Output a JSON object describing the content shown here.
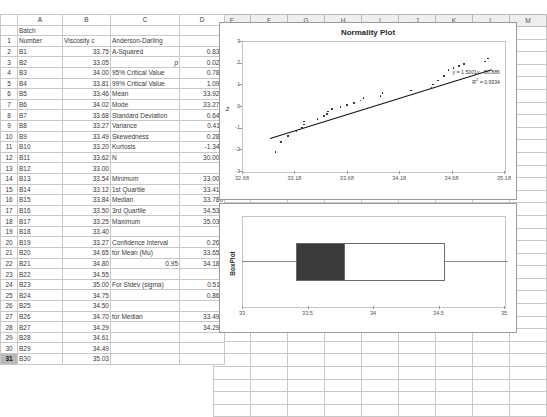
{
  "spreadsheet": {
    "column_headers": [
      "A",
      "B",
      "C",
      "D",
      "E",
      "F",
      "G",
      "H",
      "I",
      "J",
      "K",
      "L",
      "M"
    ],
    "selected_row": "31",
    "headers": {
      "a": "Batch Number",
      "a_line1": "Batch",
      "a_line2": "Number",
      "b": "Viscosity c",
      "c": "Anderson-Darling",
      "d": ""
    },
    "rows": [
      {
        "n": "2",
        "a": "B1",
        "b": "33.75",
        "c": "A-Squared",
        "d": "0.833",
        "italic": false
      },
      {
        "n": "3",
        "a": "B2",
        "b": "33.05",
        "c": "p",
        "d": "0.028",
        "italic": true
      },
      {
        "n": "4",
        "a": "B3",
        "b": "34.00",
        "c": "95% Critical Value",
        "d": "0.787",
        "italic": false
      },
      {
        "n": "5",
        "a": "B4",
        "b": "33.81",
        "c": "99% Critical Value",
        "d": "1.092",
        "italic": false
      },
      {
        "n": "6",
        "a": "B5",
        "b": "33.46",
        "c": "Mean",
        "d": "33.921",
        "italic": false
      },
      {
        "n": "7",
        "a": "B6",
        "b": "34.02",
        "c": "Mode",
        "d": "33.270",
        "italic": false
      },
      {
        "n": "8",
        "a": "B7",
        "b": "33.68",
        "c": "Standard Deviation",
        "d": "0.641",
        "italic": false
      },
      {
        "n": "9",
        "a": "B8",
        "b": "33.27",
        "c": "Variance",
        "d": "0.411",
        "italic": false
      },
      {
        "n": "10",
        "a": "B9",
        "b": "33.49",
        "c": "Skewedness",
        "d": "0.286",
        "italic": false
      },
      {
        "n": "11",
        "a": "B10",
        "b": "33.20",
        "c": "Kurtosis",
        "d": "-1.342",
        "italic": false
      },
      {
        "n": "12",
        "a": "B11",
        "b": "33.62",
        "c": "N",
        "d": "30.000",
        "italic": false
      },
      {
        "n": "13",
        "a": "B12",
        "b": "33.00",
        "c": "",
        "d": "",
        "italic": false
      },
      {
        "n": "14",
        "a": "B13",
        "b": "33.54",
        "c": "Minimum",
        "d": "33.000",
        "italic": false
      },
      {
        "n": "15",
        "a": "B14",
        "b": "33.12",
        "c": "1st Quartile",
        "d": "33.415",
        "italic": false
      },
      {
        "n": "16",
        "a": "B15",
        "b": "33.84",
        "c": "Median",
        "d": "33.780",
        "italic": false
      },
      {
        "n": "17",
        "a": "B16",
        "b": "33.50",
        "c": "3rd Quartile",
        "d": "34.538",
        "italic": false
      },
      {
        "n": "18",
        "a": "B17",
        "b": "33.25",
        "c": "Maximum",
        "d": "35.030",
        "italic": false
      },
      {
        "n": "19",
        "a": "B18",
        "b": "33.40",
        "c": "",
        "d": "",
        "italic": false
      },
      {
        "n": "20",
        "a": "B19",
        "b": "33.27",
        "c": "Confidence Interval",
        "d": "0.262",
        "italic": false
      },
      {
        "n": "21",
        "a": "B20",
        "b": "34.65",
        "c": "for Mean (Mu)",
        "d": "33.659",
        "italic": false
      },
      {
        "n": "22",
        "a": "B21",
        "b": "34.80",
        "c": "0.95",
        "d": "34.184",
        "italic": false,
        "c_right": true
      },
      {
        "n": "23",
        "a": "B22",
        "b": "34.55",
        "c": "",
        "d": "",
        "italic": false
      },
      {
        "n": "24",
        "a": "B23",
        "b": "35.00",
        "c": "For Stdev (sigma)",
        "d": "0.511",
        "italic": false
      },
      {
        "n": "25",
        "a": "B24",
        "b": "34.75",
        "c": "",
        "d": "0.862",
        "italic": false
      },
      {
        "n": "26",
        "a": "B25",
        "b": "34.50",
        "c": "",
        "d": "",
        "italic": false
      },
      {
        "n": "27",
        "a": "B26",
        "b": "34.70",
        "c": "for Median",
        "d": "33.490",
        "italic": false
      },
      {
        "n": "28",
        "a": "B27",
        "b": "34.29",
        "c": "",
        "d": "34.290",
        "italic": false
      },
      {
        "n": "29",
        "a": "B28",
        "b": "34.61",
        "c": "",
        "d": "",
        "italic": false
      },
      {
        "n": "30",
        "a": "B29",
        "b": "34.49",
        "c": "",
        "d": "",
        "italic": false
      },
      {
        "n": "31",
        "a": "B30",
        "b": "35.03",
        "c": "",
        "d": "",
        "italic": false
      }
    ]
  },
  "chart_data": [
    {
      "type": "scatter",
      "name": "normality-plot",
      "title": "Normality Plot",
      "xlabel": "",
      "ylabel": "z",
      "xlim": [
        32.68,
        35.18
      ],
      "ylim": [
        -3,
        3
      ],
      "xticks": [
        "32.68",
        "33.18",
        "33.68",
        "34.18",
        "34.68",
        "35.18"
      ],
      "yticks": [
        "-3",
        "-2",
        "-1",
        "0",
        "1",
        "2",
        "3"
      ],
      "grid": false,
      "legend": "none",
      "annotations": [
        "y = 1.5001x - 50.886",
        "R2 = 0.9334"
      ],
      "trendline": {
        "slope": 1.5001,
        "intercept": -50.886,
        "r2": 0.9334
      },
      "x": [
        33.0,
        33.05,
        33.12,
        33.2,
        33.25,
        33.27,
        33.27,
        33.4,
        33.46,
        33.49,
        33.5,
        33.54,
        33.62,
        33.68,
        33.75,
        33.81,
        33.84,
        34.0,
        34.02,
        34.29,
        34.49,
        34.5,
        34.55,
        34.61,
        34.65,
        34.7,
        34.75,
        34.8,
        35.0,
        35.03
      ],
      "y": [
        -2.13,
        -1.67,
        -1.38,
        -1.17,
        -1.0,
        -0.85,
        -0.72,
        -0.59,
        -0.47,
        -0.36,
        -0.25,
        -0.15,
        -0.05,
        0.05,
        0.15,
        0.25,
        0.36,
        0.47,
        0.59,
        0.72,
        0.85,
        1.0,
        1.17,
        1.38,
        1.67,
        1.75,
        1.85,
        1.95,
        2.05,
        2.2
      ]
    },
    {
      "type": "box",
      "name": "box-plot",
      "title": "",
      "ylabel": "BoxPlot",
      "xlim": [
        33,
        35
      ],
      "xticks": [
        "33",
        "33.5",
        "34",
        "34.5",
        "35"
      ],
      "grid": false,
      "minimum": 33.0,
      "q1": 33.415,
      "median": 33.78,
      "q3": 34.538,
      "maximum": 35.03,
      "colors": {
        "q1_box": "#3a3a3a",
        "q3_box": "#ffffff",
        "whisker": "#8a8a8a"
      }
    }
  ]
}
